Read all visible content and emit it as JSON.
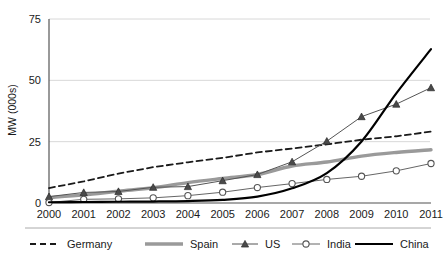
{
  "chart_data": {
    "type": "line",
    "title": "",
    "xlabel": "",
    "ylabel": "MW (000s)",
    "categories": [
      "2000",
      "2001",
      "2002",
      "2003",
      "2004",
      "2005",
      "2006",
      "2007",
      "2008",
      "2009",
      "2010",
      "2011"
    ],
    "x": [
      2000,
      2001,
      2002,
      2003,
      2004,
      2005,
      2006,
      2007,
      2008,
      2009,
      2010,
      2011
    ],
    "xlim": [
      2000,
      2011
    ],
    "ylim": [
      0,
      75
    ],
    "yticks": [
      0,
      25,
      50,
      75
    ],
    "ytick_labels": [
      "0",
      "25",
      "50",
      "75"
    ],
    "grid": "horizontal",
    "legend_position": "bottom",
    "series": [
      {
        "name": "Germany",
        "style": "dashed",
        "color": "#1a1a1a",
        "marker": "none",
        "values": [
          6.1,
          8.8,
          12.0,
          14.6,
          16.6,
          18.4,
          20.6,
          22.2,
          23.9,
          25.8,
          27.2,
          29.1
        ]
      },
      {
        "name": "Spain",
        "style": "solid-thick",
        "color": "#9a9a9a",
        "marker": "none",
        "values": [
          2.2,
          3.3,
          4.8,
          6.2,
          8.3,
          10.0,
          11.6,
          15.1,
          16.7,
          19.1,
          20.6,
          21.7
        ]
      },
      {
        "name": "US",
        "style": "solid-thin",
        "color": "#555555",
        "marker": "triangle",
        "values": [
          2.6,
          4.3,
          4.7,
          6.4,
          6.7,
          9.1,
          11.6,
          16.8,
          25.2,
          35.2,
          40.3,
          47.0
        ]
      },
      {
        "name": "India",
        "style": "solid-thin",
        "color": "#666666",
        "marker": "circle-open",
        "values": [
          0.2,
          1.5,
          1.7,
          2.1,
          3.0,
          4.4,
          6.3,
          7.9,
          9.6,
          10.9,
          13.1,
          16.1
        ]
      },
      {
        "name": "China",
        "style": "solid-bold",
        "color": "#000000",
        "marker": "none",
        "values": [
          0.3,
          0.4,
          0.5,
          0.6,
          0.8,
          1.3,
          2.6,
          6.0,
          12.2,
          25.1,
          44.7,
          62.7
        ]
      }
    ]
  },
  "axis": {
    "y_title": "MW (000s)"
  },
  "legend": {
    "items": [
      {
        "label": "Germany"
      },
      {
        "label": "Spain"
      },
      {
        "label": "US"
      },
      {
        "label": "India"
      },
      {
        "label": "China"
      }
    ]
  }
}
